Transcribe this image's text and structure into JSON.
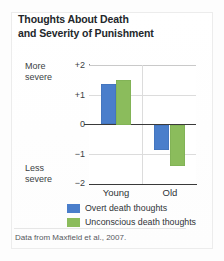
{
  "card": {
    "title_line1": "Thoughts About Death",
    "title_line2": "and Severity of Punishment",
    "source_note": "Data from Maxfield et al., 2007."
  },
  "axis_annotations": {
    "more_severe_line1": "More",
    "more_severe_line2": "severe",
    "less_severe_line1": "Less",
    "less_severe_line2": "severe"
  },
  "legend": {
    "items": [
      {
        "label": "Overt death thoughts",
        "color": "#4a7ecb"
      },
      {
        "label": "Unconscious death thoughts",
        "color": "#8bbc5c"
      }
    ]
  },
  "chart_data": {
    "type": "bar",
    "title": "Thoughts About Death and Severity of Punishment",
    "subtitle": "",
    "xlabel": "",
    "ylabel": "",
    "categories": [
      "Young",
      "Old"
    ],
    "series": [
      {
        "name": "Overt death thoughts",
        "color": "#4a7ecb",
        "values": [
          1.37,
          -0.87
        ]
      },
      {
        "name": "Unconscious death thoughts",
        "color": "#8bbc5c",
        "values": [
          1.5,
          -1.4
        ]
      }
    ],
    "ylim": [
      -2,
      2
    ],
    "yticks": [
      "+2",
      "+1",
      "0",
      "−1",
      "−2"
    ],
    "ytick_values": [
      2,
      1,
      0,
      -1,
      -2
    ],
    "y_high_annotation": "More severe",
    "y_low_annotation": "Less severe",
    "grid": true,
    "legend_position": "bottom",
    "zero_line": true,
    "source": "Data from Maxfield et al., 2007."
  }
}
